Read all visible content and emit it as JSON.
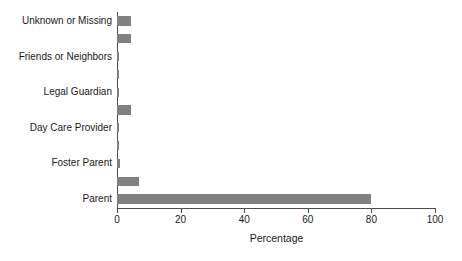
{
  "chart_data": {
    "type": "bar",
    "orientation": "horizontal",
    "title": "",
    "xlabel": "Percentage",
    "ylabel": "",
    "xlim": [
      0,
      100
    ],
    "xticks": [
      0,
      20,
      40,
      60,
      80,
      100
    ],
    "xtick_labels": [
      "0",
      "20",
      "40",
      "60",
      "80",
      "100"
    ],
    "grid": false,
    "legend": null,
    "bar_color": "#808080",
    "axis_color": "#4d4d4d",
    "text_color": "#1a1a1a",
    "background": "#ffffff",
    "n_bars": 11,
    "categories": [
      "Parent",
      "",
      "Foster Parent",
      "",
      "Day Care Provider",
      "",
      "Legal Guardian",
      "",
      "Friends or Neighbors",
      "",
      "Unknown or Missing"
    ],
    "values": [
      80.0,
      6.8,
      0.9,
      0.5,
      0.6,
      4.3,
      0.5,
      0.5,
      0.6,
      4.3,
      4.3
    ],
    "labeled_categories": [
      "Parent",
      "Foster Parent",
      "Day Care Provider",
      "Legal Guardian",
      "Friends or Neighbors",
      "Unknown or Missing"
    ],
    "labeled_values": [
      80.0,
      0.9,
      0.6,
      0.5,
      0.6,
      4.3
    ]
  },
  "axis": {
    "x_title": "Percentage"
  }
}
